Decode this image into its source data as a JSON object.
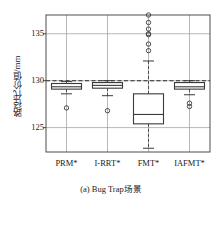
{
  "chart_data": {
    "type": "box",
    "title": "",
    "caption": "(a) Bug Trap场景",
    "xlabel": "",
    "ylabel": "路径代价值/mm",
    "categories": [
      "PRM*",
      "I-RRT*",
      "FMT*",
      "IAFMT*"
    ],
    "ylim": [
      122.4,
      137.0
    ],
    "yticks": [
      125,
      130,
      135
    ],
    "ytick_labels": [
      "125",
      "130",
      "135"
    ],
    "grid": "both",
    "legend": "none",
    "reference_line": {
      "value": 130,
      "style": "dashed"
    },
    "boxes": [
      {
        "name": "PRM*",
        "whisker_low": 128.6,
        "q1": 129.1,
        "median": 129.35,
        "q3": 129.7,
        "whisker_high": 129.9,
        "outliers": [
          127.1
        ]
      },
      {
        "name": "I-RRT*",
        "whisker_low": 128.4,
        "q1": 129.2,
        "median": 129.5,
        "q3": 129.8,
        "whisker_high": 130.0,
        "outliers": [
          126.8
        ]
      },
      {
        "name": "FMT*",
        "whisker_low": 122.8,
        "q1": 125.4,
        "median": 126.4,
        "q3": 128.6,
        "whisker_high": 132.1,
        "outliers": [
          137.0,
          136.2,
          135.5,
          135.0,
          134.9,
          133.9,
          133.2
        ]
      },
      {
        "name": "IAFMT*",
        "whisker_low": 128.5,
        "q1": 129.1,
        "median": 129.35,
        "q3": 129.8,
        "whisker_high": 130.0,
        "outliers": [
          127.6,
          127.25
        ]
      }
    ]
  },
  "style": {
    "axis_color": "#3a3a3a",
    "grid_color": "#9a9a9a",
    "box_color": "#3a3a3a",
    "text_color": "#1a1a1a"
  }
}
